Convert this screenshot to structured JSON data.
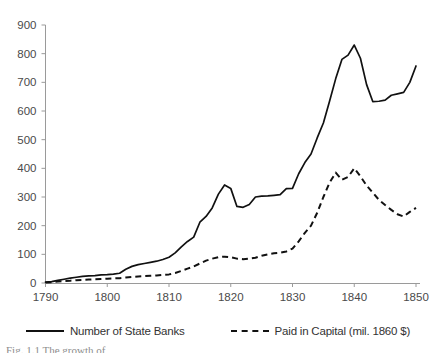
{
  "chart_data": {
    "type": "line",
    "title": "",
    "xlabel": "",
    "ylabel": "",
    "xlim": [
      1790,
      1850
    ],
    "ylim": [
      0,
      900
    ],
    "grid": false,
    "legend_position": "bottom",
    "x_ticks": [
      1790,
      1800,
      1810,
      1820,
      1830,
      1840,
      1850
    ],
    "y_ticks": [
      0,
      100,
      200,
      300,
      400,
      500,
      600,
      700,
      800,
      900
    ],
    "x": [
      1790,
      1791,
      1792,
      1793,
      1794,
      1795,
      1796,
      1797,
      1798,
      1799,
      1800,
      1801,
      1802,
      1803,
      1804,
      1805,
      1806,
      1807,
      1808,
      1809,
      1810,
      1811,
      1812,
      1813,
      1814,
      1815,
      1816,
      1817,
      1818,
      1819,
      1820,
      1821,
      1822,
      1823,
      1824,
      1825,
      1826,
      1827,
      1828,
      1829,
      1830,
      1831,
      1832,
      1833,
      1834,
      1835,
      1836,
      1837,
      1838,
      1839,
      1840,
      1841,
      1842,
      1843,
      1844,
      1845,
      1846,
      1847,
      1848,
      1849,
      1850
    ],
    "series": [
      {
        "name": "Number of State Banks",
        "style": "solid",
        "color": "#111111",
        "values": [
          3,
          5,
          9,
          13,
          17,
          20,
          23,
          25,
          26,
          28,
          29,
          31,
          34,
          48,
          58,
          64,
          68,
          72,
          76,
          82,
          90,
          105,
          126,
          145,
          160,
          212,
          232,
          262,
          310,
          342,
          330,
          267,
          264,
          274,
          300,
          303,
          304,
          306,
          308,
          329,
          330,
          381,
          420,
          450,
          506,
          558,
          634,
          713,
          780,
          795,
          830,
          784,
          692,
          633,
          634,
          638,
          655,
          660,
          665,
          700,
          757
        ]
      },
      {
        "name": "Paid in Capital (mil. 1860 $)",
        "style": "dashed",
        "color": "#111111",
        "values": [
          2,
          3,
          5,
          7,
          8,
          10,
          11,
          12,
          13,
          14,
          15,
          16,
          17,
          19,
          21,
          23,
          24,
          25,
          26,
          28,
          30,
          35,
          42,
          50,
          58,
          68,
          78,
          85,
          90,
          92,
          90,
          85,
          83,
          85,
          88,
          95,
          100,
          104,
          106,
          110,
          120,
          145,
          175,
          200,
          245,
          300,
          350,
          385,
          360,
          370,
          400,
          372,
          340,
          315,
          290,
          272,
          255,
          240,
          232,
          248,
          262
        ]
      }
    ]
  },
  "legend": {
    "entries": [
      {
        "label": "Number of State Banks",
        "style": "solid"
      },
      {
        "label": "Paid in Capital (mil. 1860 $)",
        "style": "dashed"
      }
    ]
  },
  "caption": {
    "text": "Fig. 1.1   The growth of"
  }
}
